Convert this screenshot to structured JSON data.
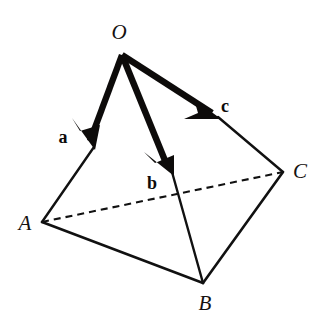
{
  "figure": {
    "name": "tetrahedron-vector-diagram",
    "background_color": "#ffffff",
    "stroke_color": "#111111",
    "vector_color": "#0d0b0a",
    "width": 315,
    "height": 324
  },
  "vertices": [
    {
      "id": "O",
      "label": "O",
      "x": 122,
      "y": 55,
      "label_x": 119,
      "label_y": 32
    },
    {
      "id": "A",
      "label": "A",
      "x": 42,
      "y": 222,
      "label_x": 25,
      "label_y": 223
    },
    {
      "id": "B",
      "label": "B",
      "x": 203,
      "y": 283,
      "label_x": 205,
      "label_y": 303
    },
    {
      "id": "C",
      "label": "C",
      "x": 283,
      "y": 172,
      "label_x": 300,
      "label_y": 171
    }
  ],
  "vectors": [
    {
      "id": "a",
      "label": "a",
      "from": "O",
      "to": "A",
      "tail_x": 122,
      "tail_y": 55,
      "head_x": 94,
      "head_y": 147,
      "label_x": 63,
      "label_y": 137
    },
    {
      "id": "b",
      "label": "b",
      "from": "O",
      "to": "B",
      "tail_x": 122,
      "tail_y": 55,
      "head_x": 172,
      "head_y": 172,
      "label_x": 152,
      "label_y": 183
    },
    {
      "id": "c",
      "label": "c",
      "from": "O",
      "to": "C",
      "tail_x": 122,
      "tail_y": 55,
      "head_x": 218,
      "head_y": 117,
      "label_x": 225,
      "label_y": 106
    }
  ],
  "edges": [
    {
      "id": "a-tail-to-A",
      "from_x": 94,
      "from_y": 147,
      "to_x": 42,
      "to_y": 222,
      "style": "solid"
    },
    {
      "id": "b-tail-to-B",
      "from_x": 172,
      "from_y": 172,
      "to_x": 203,
      "to_y": 283,
      "style": "solid"
    },
    {
      "id": "c-tail-to-C",
      "from_x": 218,
      "from_y": 117,
      "to_x": 283,
      "to_y": 172,
      "style": "solid"
    },
    {
      "id": "A-to-B",
      "from_x": 42,
      "from_y": 222,
      "to_x": 203,
      "to_y": 283,
      "style": "solid"
    },
    {
      "id": "B-to-C",
      "from_x": 203,
      "from_y": 283,
      "to_x": 283,
      "to_y": 172,
      "style": "solid"
    },
    {
      "id": "A-to-C",
      "from_x": 42,
      "from_y": 222,
      "to_x": 283,
      "to_y": 172,
      "style": "dashed"
    }
  ],
  "strokes": {
    "edge_width": 2.4,
    "vector_width": 6,
    "dash_pattern": "7 5"
  }
}
